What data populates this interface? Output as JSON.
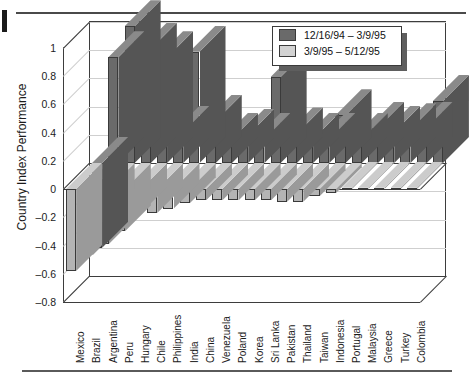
{
  "figure": {
    "axis_title": "Country Index Performance"
  },
  "legend": {
    "entries": [
      {
        "label": "12/16/94 – 3/9/95",
        "color": "#6a6a6a"
      },
      {
        "label": "3/9/95 – 5/12/95",
        "color": "#d2d2d2"
      }
    ]
  },
  "colors": {
    "series1": "#6a6a6a",
    "series2": "#b4b4b4",
    "series1_top": "#8a8a8a",
    "series2_top": "#cccccc",
    "series1_side": "#555555",
    "series2_side": "#9a9a9a",
    "axis": "#3d3d3d",
    "grid": "#cfcfcf"
  },
  "chart_data": {
    "type": "bar",
    "title": "",
    "xlabel": "",
    "ylabel": "Country Index Performance",
    "ylim": [
      -0.8,
      1.0
    ],
    "yticks": [
      1,
      0.8,
      0.6,
      0.4,
      0.2,
      0,
      -0.2,
      -0.4,
      -0.6,
      -0.8
    ],
    "ytick_labels": [
      "1",
      "0.8",
      "0.6",
      "0.4",
      "0.2",
      "0",
      "–0.2",
      "–0.4",
      "–0.6",
      "–0.8"
    ],
    "grid": true,
    "legend_position": "top-right",
    "projection": "3d-bar",
    "categories": [
      "Mexico",
      "Brazil",
      "Argentina",
      "Peru",
      "Hungary",
      "Chile",
      "Philippines",
      "India",
      "China",
      "Venezuela",
      "Poland",
      "Korea",
      "Sri Lanka",
      "Pakistan",
      "Thailand",
      "Taiwan",
      "Indonesia",
      "Portugal",
      "Malaysia",
      "Greece",
      "Turkey",
      "Colombia"
    ],
    "series": [
      {
        "name": "12/16/94 – 3/9/95",
        "color": "#6a6a6a",
        "values": [
          -0.6,
          0.75,
          0.97,
          0.81,
          0.75,
          0.22,
          0.79,
          0.3,
          0.17,
          0.2,
          0.17,
          0.61,
          0.21,
          0.17,
          0.17,
          0.34,
          0.17,
          0.25,
          0.22,
          0.24,
          0.25,
          0.44
        ]
      },
      {
        "name": "3/9/95 – 5/12/95",
        "color": "#b4b4b4",
        "values": [
          -0.58,
          -0.47,
          -0.39,
          -0.3,
          -0.17,
          -0.17,
          -0.14,
          -0.1,
          -0.08,
          -0.08,
          -0.08,
          -0.08,
          -0.08,
          -0.09,
          -0.09,
          -0.05,
          -0.03,
          0.01,
          0.01,
          0.01,
          0.01,
          0.01
        ]
      }
    ]
  }
}
